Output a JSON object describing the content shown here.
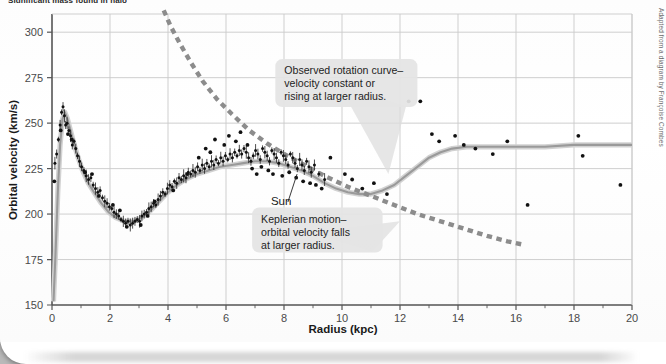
{
  "page": {
    "clipped_heading": "Significant mass found in halo",
    "credit": "Adapted from a diagram by Françoise Combes"
  },
  "chart_data": {
    "type": "scatter",
    "title": "",
    "xlabel": "Radius (kpc)",
    "ylabel": "Orbital velocity (km/s)",
    "xlim": [
      0,
      20
    ],
    "ylim": [
      150,
      310
    ],
    "xticks": [
      0,
      2,
      4,
      6,
      8,
      10,
      12,
      14,
      16,
      18,
      20
    ],
    "xtick_labels": [
      "0",
      "2",
      "4",
      "6",
      "8",
      "10",
      "12",
      "14",
      "16",
      "18",
      "20"
    ],
    "x_minor_step": 1,
    "yticks": [
      150,
      175,
      200,
      225,
      250,
      275,
      300
    ],
    "ytick_labels": [
      "150",
      "175",
      "200",
      "225",
      "250",
      "275",
      "300"
    ],
    "grid": true,
    "legend": "none",
    "series": [
      {
        "name": "Observed rotation curve (model fit)",
        "type": "line",
        "style": "solid",
        "color": "#9a9a9a",
        "points": [
          [
            0.05,
            152
          ],
          [
            0.12,
            178
          ],
          [
            0.2,
            212
          ],
          [
            0.28,
            238
          ],
          [
            0.36,
            252
          ],
          [
            0.44,
            256
          ],
          [
            0.52,
            253
          ],
          [
            0.62,
            247
          ],
          [
            0.75,
            239
          ],
          [
            0.9,
            231
          ],
          [
            1.05,
            224
          ],
          [
            1.25,
            217
          ],
          [
            1.45,
            212
          ],
          [
            1.7,
            206
          ],
          [
            1.95,
            201
          ],
          [
            2.2,
            198
          ],
          [
            2.5,
            196
          ],
          [
            2.8,
            196
          ],
          [
            3.1,
            198
          ],
          [
            3.4,
            202
          ],
          [
            3.7,
            207
          ],
          [
            4.0,
            212
          ],
          [
            4.3,
            216
          ],
          [
            4.6,
            219
          ],
          [
            5.0,
            222
          ],
          [
            5.4,
            224
          ],
          [
            5.8,
            226
          ],
          [
            6.2,
            227
          ],
          [
            6.6,
            228
          ],
          [
            7.0,
            229
          ],
          [
            7.4,
            229
          ],
          [
            7.8,
            228
          ],
          [
            8.2,
            226
          ],
          [
            8.6,
            224
          ],
          [
            9.0,
            221
          ],
          [
            9.4,
            217
          ],
          [
            9.8,
            214
          ],
          [
            10.2,
            212
          ],
          [
            10.6,
            211
          ],
          [
            11.0,
            211
          ],
          [
            11.4,
            213
          ],
          [
            11.8,
            216
          ],
          [
            12.2,
            221
          ],
          [
            12.6,
            226
          ],
          [
            13.0,
            231
          ],
          [
            13.4,
            234
          ],
          [
            13.8,
            236
          ],
          [
            14.3,
            237
          ],
          [
            15.0,
            237
          ],
          [
            16.0,
            237
          ],
          [
            17.0,
            237
          ],
          [
            18.0,
            238
          ],
          [
            19.0,
            238
          ],
          [
            20.0,
            238
          ]
        ]
      },
      {
        "name": "Keplerian motion",
        "type": "line",
        "style": "dashed",
        "color": "#8c8c8c",
        "points": [
          [
            3.85,
            312
          ],
          [
            4.1,
            303
          ],
          [
            4.4,
            294
          ],
          [
            4.8,
            283
          ],
          [
            5.2,
            273
          ],
          [
            5.7,
            263
          ],
          [
            6.2,
            255
          ],
          [
            6.8,
            246
          ],
          [
            7.4,
            239
          ],
          [
            8.0,
            233
          ],
          [
            8.7,
            227
          ],
          [
            9.4,
            221
          ],
          [
            10.2,
            215
          ],
          [
            11.0,
            210
          ],
          [
            11.8,
            205
          ],
          [
            12.6,
            200
          ],
          [
            13.4,
            196
          ],
          [
            14.2,
            192
          ],
          [
            15.0,
            188
          ],
          [
            15.7,
            185
          ],
          [
            16.3,
            183
          ]
        ]
      },
      {
        "name": "Observed data (inner disk, with error bars)",
        "type": "scatter",
        "color": "#111111",
        "marker": "dot",
        "points": [
          [
            0.1,
            228
          ],
          [
            0.16,
            233
          ],
          [
            0.22,
            241
          ],
          [
            0.28,
            249
          ],
          [
            0.33,
            256
          ],
          [
            0.38,
            259
          ],
          [
            0.43,
            254
          ],
          [
            0.47,
            249
          ],
          [
            0.52,
            250
          ],
          [
            0.58,
            246
          ],
          [
            0.64,
            243
          ],
          [
            0.7,
            238
          ],
          [
            0.76,
            240
          ],
          [
            0.82,
            236
          ],
          [
            0.88,
            232
          ],
          [
            0.95,
            229
          ],
          [
            1.02,
            226
          ],
          [
            1.1,
            224
          ],
          [
            1.18,
            221
          ],
          [
            1.26,
            219
          ],
          [
            1.34,
            220
          ],
          [
            1.42,
            216
          ],
          [
            1.5,
            214
          ],
          [
            1.58,
            212
          ],
          [
            1.66,
            213
          ],
          [
            1.74,
            209
          ],
          [
            1.82,
            207
          ],
          [
            1.9,
            206
          ],
          [
            1.98,
            204
          ],
          [
            2.06,
            203
          ],
          [
            2.14,
            201
          ],
          [
            2.22,
            200
          ],
          [
            2.3,
            199
          ],
          [
            2.38,
            197
          ],
          [
            2.46,
            196
          ],
          [
            2.54,
            195
          ],
          [
            2.62,
            196
          ],
          [
            2.7,
            194
          ],
          [
            2.78,
            195
          ],
          [
            2.86,
            196
          ],
          [
            2.94,
            197
          ],
          [
            3.02,
            196
          ],
          [
            3.1,
            199
          ],
          [
            3.18,
            200
          ],
          [
            3.26,
            201
          ],
          [
            3.34,
            203
          ],
          [
            3.42,
            204
          ],
          [
            3.5,
            206
          ],
          [
            3.58,
            205
          ],
          [
            3.66,
            208
          ],
          [
            3.74,
            210
          ],
          [
            3.82,
            212
          ],
          [
            3.9,
            211
          ],
          [
            3.98,
            214
          ],
          [
            4.06,
            216
          ],
          [
            4.14,
            215
          ],
          [
            4.22,
            218
          ],
          [
            4.3,
            217
          ],
          [
            4.38,
            220
          ],
          [
            4.46,
            219
          ],
          [
            4.54,
            221
          ],
          [
            4.62,
            220
          ],
          [
            4.7,
            223
          ],
          [
            4.78,
            222
          ],
          [
            4.86,
            224
          ],
          [
            4.94,
            223
          ],
          [
            5.02,
            226
          ],
          [
            5.1,
            224
          ],
          [
            5.18,
            227
          ],
          [
            5.26,
            225
          ],
          [
            5.34,
            228
          ],
          [
            5.42,
            226
          ],
          [
            5.5,
            229
          ],
          [
            5.58,
            227
          ],
          [
            5.66,
            230
          ],
          [
            5.74,
            228
          ],
          [
            5.82,
            231
          ],
          [
            5.9,
            229
          ],
          [
            5.98,
            232
          ],
          [
            6.06,
            230
          ],
          [
            6.14,
            233
          ],
          [
            6.22,
            231
          ],
          [
            6.3,
            234
          ],
          [
            6.38,
            232
          ],
          [
            6.46,
            235
          ],
          [
            6.54,
            233
          ],
          [
            6.62,
            236
          ],
          [
            6.7,
            234
          ],
          [
            6.78,
            231
          ],
          [
            6.86,
            229
          ],
          [
            6.94,
            232
          ],
          [
            7.02,
            235
          ],
          [
            7.1,
            233
          ],
          [
            7.18,
            230
          ],
          [
            7.26,
            236
          ],
          [
            7.34,
            234
          ],
          [
            7.42,
            232
          ],
          [
            7.5,
            229
          ],
          [
            7.58,
            235
          ],
          [
            7.66,
            233
          ],
          [
            7.74,
            231
          ],
          [
            7.82,
            228
          ],
          [
            7.9,
            234
          ],
          [
            7.98,
            232
          ],
          [
            8.06,
            230
          ],
          [
            8.14,
            227
          ],
          [
            8.22,
            233
          ],
          [
            8.3,
            231
          ],
          [
            8.38,
            228
          ],
          [
            8.46,
            225
          ],
          [
            8.54,
            230
          ],
          [
            8.62,
            227
          ],
          [
            8.7,
            224
          ],
          [
            8.78,
            229
          ],
          [
            8.86,
            226
          ],
          [
            8.94,
            223
          ],
          [
            9.05,
            227
          ],
          [
            9.2,
            222
          ],
          [
            9.4,
            219
          ]
        ]
      },
      {
        "name": "Observed data (scattered, large radius)",
        "type": "scatter",
        "color": "#111111",
        "marker": "dot",
        "points": [
          [
            0.08,
            218
          ],
          [
            0.3,
            246
          ],
          [
            0.55,
            244
          ],
          [
            0.68,
            241
          ],
          [
            1.14,
            223
          ],
          [
            1.38,
            222
          ],
          [
            1.62,
            210
          ],
          [
            2.1,
            205
          ],
          [
            2.34,
            202
          ],
          [
            2.58,
            193
          ],
          [
            3.06,
            194
          ],
          [
            3.3,
            199
          ],
          [
            3.54,
            207
          ],
          [
            4.18,
            213
          ],
          [
            4.66,
            222
          ],
          [
            5.06,
            231
          ],
          [
            5.3,
            236
          ],
          [
            5.46,
            234
          ],
          [
            5.62,
            241
          ],
          [
            5.94,
            238
          ],
          [
            6.1,
            243
          ],
          [
            6.34,
            240
          ],
          [
            6.5,
            245
          ],
          [
            6.74,
            238
          ],
          [
            6.9,
            225
          ],
          [
            7.06,
            222
          ],
          [
            7.22,
            226
          ],
          [
            7.46,
            224
          ],
          [
            7.62,
            222
          ],
          [
            7.94,
            221
          ],
          [
            8.18,
            223
          ],
          [
            8.42,
            220
          ],
          [
            8.66,
            218
          ],
          [
            8.9,
            217
          ],
          [
            9.1,
            216
          ],
          [
            9.3,
            214
          ],
          [
            9.6,
            231
          ],
          [
            10.1,
            222
          ],
          [
            10.35,
            219
          ],
          [
            10.7,
            214
          ],
          [
            11.1,
            217
          ],
          [
            11.55,
            211
          ],
          [
            12.3,
            262
          ],
          [
            12.7,
            262
          ],
          [
            13.1,
            244
          ],
          [
            13.35,
            240
          ],
          [
            13.9,
            243
          ],
          [
            14.2,
            238
          ],
          [
            14.6,
            236
          ],
          [
            15.2,
            233
          ],
          [
            15.7,
            240
          ],
          [
            16.4,
            205
          ],
          [
            18.15,
            243
          ],
          [
            18.3,
            232
          ],
          [
            19.6,
            216
          ]
        ]
      }
    ],
    "annotations": [
      {
        "name": "observed-callout",
        "lines": [
          "Observed rotation curve–",
          "velocity constant or",
          "rising at larger radius."
        ],
        "box": {
          "x": 0.385,
          "y": 0.155,
          "w": 0.245,
          "h": 0.165
        },
        "pointer_to": [
          11.6,
          222
        ]
      },
      {
        "name": "keplerian-callout",
        "lines": [
          "Keplerian motion–",
          "orbital velocity falls",
          "at larger radius."
        ],
        "box": {
          "x": 0.345,
          "y": 0.665,
          "w": 0.225,
          "h": 0.155
        },
        "pointer_to": [
          12.0,
          196
        ]
      },
      {
        "name": "sun-label",
        "lines": [
          "Sun"
        ],
        "at": [
          7.55,
          205
        ],
        "pointer_to": [
          8.45,
          222
        ]
      }
    ]
  }
}
